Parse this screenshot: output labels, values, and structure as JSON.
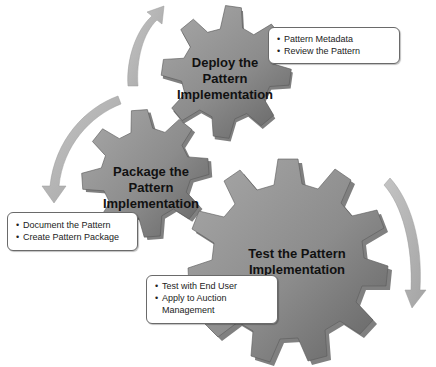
{
  "diagram": {
    "colors": {
      "gear_fill_light": "#9c9c9c",
      "gear_fill_dark": "#6e6e6e",
      "gear_shadow": "#4a4a4a",
      "arrow_fill": "#b5b5b5",
      "callout_border": "#6a6a6a"
    },
    "gears": [
      {
        "id": "deploy",
        "label_lines": [
          "Deploy the",
          "Pattern",
          "Implementation"
        ],
        "callout": [
          "Pattern Metadata",
          "Review the Pattern"
        ]
      },
      {
        "id": "package",
        "label_lines": [
          "Package the",
          "Pattern",
          "Implementation"
        ],
        "callout": [
          "Document the Pattern",
          "Create Pattern Package"
        ]
      },
      {
        "id": "test",
        "label_lines": [
          "Test the Pattern",
          "Implementation"
        ],
        "callout": [
          "Test with End User",
          "Apply to Auction",
          "Management"
        ]
      }
    ],
    "arrows": [
      {
        "id": "arrow-package-to-deploy",
        "direction": "up-right"
      },
      {
        "id": "arrow-deploy-to-package",
        "direction": "down-left"
      },
      {
        "id": "arrow-test-cycle",
        "direction": "down"
      }
    ]
  }
}
